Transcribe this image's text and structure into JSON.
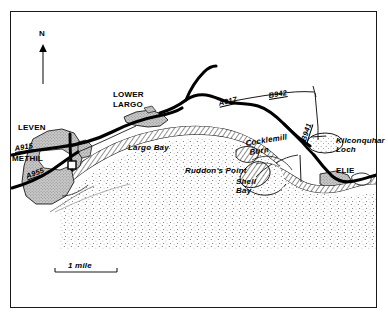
{
  "figure": {
    "kind": "line-map",
    "region": "Largo Bay coast, Fife, Scotland",
    "background_color": "#ffffff",
    "ink_color": "#000000",
    "urban_fill_color": "#b0b0b0",
    "frame": {
      "visible": true,
      "color": "#1a1a1a"
    }
  },
  "compass": {
    "label": "N",
    "direction": "up"
  },
  "scale_bar": {
    "label": "1 mile",
    "length_px": 62
  },
  "towns": [
    {
      "name": "LEVEN"
    },
    {
      "name": "METHIL"
    },
    {
      "name": "LOWER\nLARGO"
    },
    {
      "name": "ELIE"
    }
  ],
  "town_labels": {
    "leven": "LEVEN",
    "methil": "METHIL",
    "lower_largo_line1": "LOWER",
    "lower_largo_line2": "LARGO",
    "elie": "ELIE"
  },
  "roads": [
    {
      "number": "A915",
      "class": "A"
    },
    {
      "number": "A955",
      "class": "A"
    },
    {
      "number": "A917",
      "class": "A"
    },
    {
      "number": "B942",
      "class": "B"
    },
    {
      "number": "B941",
      "class": "B"
    }
  ],
  "road_labels": {
    "a915": "A915",
    "a955": "A955",
    "a917": "A917",
    "b942": "B942",
    "b941": "B941"
  },
  "water_features": [
    {
      "name": "Largo Bay",
      "type": "bay"
    },
    {
      "name": "Shell\nBay",
      "type": "bay"
    },
    {
      "name": "Cocklemill\nBurn",
      "type": "burn"
    },
    {
      "name": "Kilconquhar\nLoch",
      "type": "loch"
    }
  ],
  "water_labels": {
    "largo_bay": "Largo Bay",
    "shell_bay_line1": "Shell",
    "shell_bay_line2": "Bay",
    "cocklemill_line1": "Cocklemill",
    "cocklemill_line2": "Burn",
    "kilconquhar_line1": "Kilconquhar",
    "kilconquhar_line2": "Loch"
  },
  "headlands": [
    {
      "name": "Ruddon's Point",
      "type": "point"
    }
  ],
  "headland_labels": {
    "ruddons_point": "Ruddon's Point"
  }
}
